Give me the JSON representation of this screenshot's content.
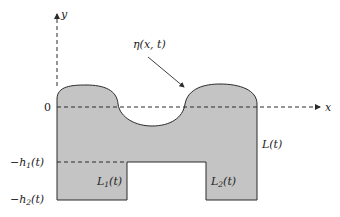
{
  "diagram": {
    "axes": {
      "x_label": "x",
      "y_label": "y",
      "origin_label": "0"
    },
    "surface_label": "η(x, t)",
    "level_labels": [
      {
        "id": "h1",
        "prefix": "−h",
        "sub": "1",
        "suffix": "(t)"
      },
      {
        "id": "h2",
        "prefix": "−h",
        "sub": "2",
        "suffix": "(t)"
      }
    ],
    "region_labels": [
      {
        "id": "L",
        "text": "L(t)"
      },
      {
        "id": "L1",
        "prefix": "L",
        "sub": "1",
        "suffix": "(t)"
      },
      {
        "id": "L2",
        "prefix": "L",
        "sub": "2",
        "suffix": "(t)"
      }
    ],
    "colors": {
      "fill": "#c4c4c4",
      "stroke": "#2a2a2a",
      "background": "#ffffff"
    }
  }
}
